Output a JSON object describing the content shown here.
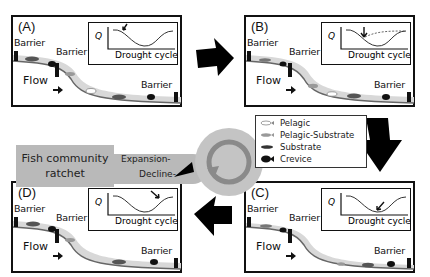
{
  "figure": {
    "panels": [
      {
        "id": "A",
        "label": "(A)",
        "barriers": [
          "Barrier",
          "Barrier",
          "Barrier"
        ],
        "flow_label": "Flow",
        "inset": {
          "y_label": "Q",
          "x_label": "Drought cycle",
          "arrow_position": "early-decline",
          "dashed_recovery": false
        }
      },
      {
        "id": "B",
        "label": "(B)",
        "barriers": [
          "Barrier",
          "Barrier",
          "Barrier"
        ],
        "flow_label": "Flow",
        "inset": {
          "y_label": "Q",
          "x_label": "Drought cycle",
          "arrow_position": "mid-decline",
          "dashed_recovery": true
        }
      },
      {
        "id": "C",
        "label": "(C)",
        "barriers": [
          "Barrier",
          "Barrier",
          "Barrier"
        ],
        "flow_label": "Flow",
        "inset": {
          "y_label": "Q",
          "x_label": "Drought cycle",
          "arrow_position": "trough",
          "dashed_recovery": false
        }
      },
      {
        "id": "D",
        "label": "(D)",
        "barriers": [
          "Barrier",
          "Barrier",
          "Barrier"
        ],
        "flow_label": "Flow",
        "inset": {
          "y_label": "Q",
          "x_label": "Drought cycle",
          "arrow_position": "recovery",
          "dashed_recovery": false
        }
      }
    ],
    "ratchet": {
      "title_line1": "Fish community",
      "title_line2": "ratchet",
      "expansion_label": "Expansion-",
      "decline_label": "Decline-"
    },
    "legend": {
      "items": [
        {
          "label": "Pelagic",
          "icon": "fish-outline-white",
          "color": "#ffffff"
        },
        {
          "label": "Pelagic-Substrate",
          "icon": "fish-light-gray",
          "color": "#9a9a9a"
        },
        {
          "label": "Substrate",
          "icon": "fish-dark-elongated",
          "color": "#444444"
        },
        {
          "label": "Crevice",
          "icon": "fish-black-round",
          "color": "#111111"
        }
      ]
    },
    "cycle_arrows": [
      "A-to-B",
      "B-to-C",
      "C-to-D",
      "D-to-A"
    ],
    "colors": {
      "stream": "#d8d8d8",
      "stream_edge": "#666666",
      "ratchet_gray": "#b9b9b9",
      "barrier": "#111111"
    }
  }
}
